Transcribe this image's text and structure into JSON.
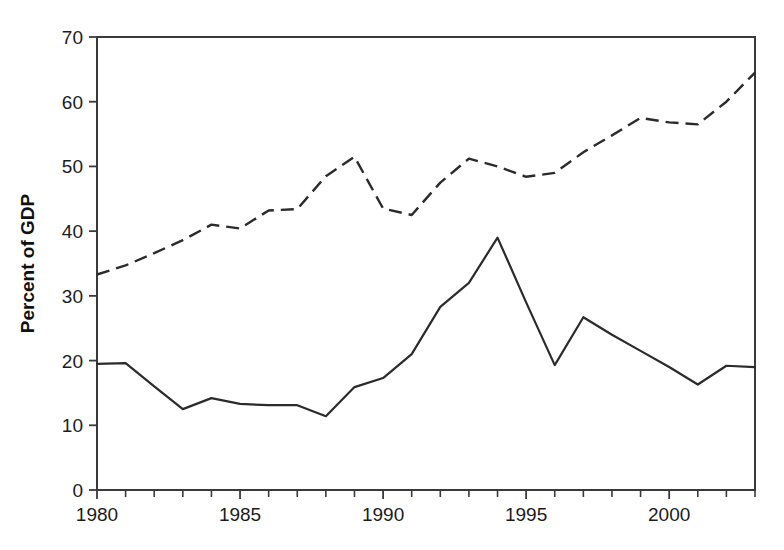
{
  "chart_data": {
    "type": "line",
    "title": "",
    "subtitle": "",
    "xlabel": "",
    "ylabel": "Percent of GDP",
    "xlim": [
      1980,
      2003
    ],
    "ylim": [
      0,
      70
    ],
    "grid": false,
    "legend": "none",
    "x_tick_labels": [
      "1980",
      "1985",
      "1990",
      "1995",
      "2000"
    ],
    "x_tick_values": [
      1980,
      1985,
      1990,
      1995,
      2000
    ],
    "x_minor_ticks_every": 1,
    "y_tick_labels": [
      "0",
      "10",
      "20",
      "30",
      "40",
      "50",
      "60",
      "70"
    ],
    "y_tick_values": [
      0,
      10,
      20,
      30,
      40,
      50,
      60,
      70
    ],
    "x": [
      1980,
      1981,
      1982,
      1983,
      1984,
      1985,
      1986,
      1987,
      1988,
      1989,
      1990,
      1991,
      1992,
      1993,
      1994,
      1995,
      1996,
      1997,
      1998,
      1999,
      2000,
      2001,
      2002,
      2003
    ],
    "series": [
      {
        "name": "solid-line",
        "style": "solid",
        "color": "#2b2b2b",
        "values": [
          19.5,
          19.6,
          16.0,
          12.5,
          14.2,
          13.3,
          13.1,
          13.1,
          11.4,
          15.9,
          17.3,
          21.0,
          28.3,
          32.0,
          39.0,
          29.0,
          19.3,
          26.7,
          24.0,
          21.5,
          19.0,
          16.3,
          19.2,
          19.0
        ]
      },
      {
        "name": "dashed-line",
        "style": "dashed",
        "color": "#2b2b2b",
        "values": [
          33.3,
          34.7,
          36.6,
          38.6,
          41.0,
          40.4,
          43.2,
          43.4,
          48.5,
          51.5,
          43.5,
          42.5,
          47.5,
          51.2,
          50.0,
          48.4,
          49.0,
          52.2,
          54.8,
          57.5,
          56.8,
          56.5,
          60.0,
          64.5
        ]
      }
    ]
  },
  "axes": {
    "y_title": "Percent of GDP"
  }
}
